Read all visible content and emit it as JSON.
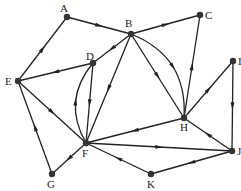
{
  "graph": {
    "directed": true,
    "nodes": [
      {
        "id": "A",
        "x": 67,
        "y": 17,
        "lx": 60,
        "ly": 12
      },
      {
        "id": "B",
        "x": 131,
        "y": 34,
        "lx": 125,
        "ly": 27
      },
      {
        "id": "C",
        "x": 200,
        "y": 15,
        "lx": 205,
        "ly": 19
      },
      {
        "id": "D",
        "x": 93,
        "y": 63,
        "lx": 86,
        "ly": 60
      },
      {
        "id": "E",
        "x": 18,
        "y": 81,
        "lx": 5,
        "ly": 85
      },
      {
        "id": "F",
        "x": 86,
        "y": 143,
        "lx": 82,
        "ly": 157
      },
      {
        "id": "G",
        "x": 52,
        "y": 174,
        "lx": 47,
        "ly": 188
      },
      {
        "id": "H",
        "x": 184,
        "y": 118,
        "lx": 180,
        "ly": 131
      },
      {
        "id": "I",
        "x": 233,
        "y": 61,
        "lx": 238,
        "ly": 65
      },
      {
        "id": "J",
        "x": 232,
        "y": 151,
        "lx": 237,
        "ly": 155
      },
      {
        "id": "K",
        "x": 151,
        "y": 174,
        "lx": 147,
        "ly": 188
      }
    ],
    "edges": [
      {
        "from": "A",
        "to": "B"
      },
      {
        "from": "B",
        "to": "C"
      },
      {
        "from": "E",
        "to": "A"
      },
      {
        "from": "B",
        "to": "D"
      },
      {
        "from": "D",
        "to": "E"
      },
      {
        "from": "B",
        "to": "F"
      },
      {
        "from": "B",
        "to": "H"
      },
      {
        "from": "B",
        "to": "H",
        "curve": -18
      },
      {
        "from": "D",
        "to": "F"
      },
      {
        "from": "F",
        "to": "D",
        "curve": -14
      },
      {
        "from": "E",
        "to": "F"
      },
      {
        "from": "G",
        "to": "E"
      },
      {
        "from": "F",
        "to": "G"
      },
      {
        "from": "H",
        "to": "C"
      },
      {
        "from": "H",
        "to": "I"
      },
      {
        "from": "H",
        "to": "F"
      },
      {
        "from": "I",
        "to": "J"
      },
      {
        "from": "J",
        "to": "H"
      },
      {
        "from": "F",
        "to": "J"
      },
      {
        "from": "J",
        "to": "K"
      },
      {
        "from": "K",
        "to": "F"
      }
    ]
  }
}
